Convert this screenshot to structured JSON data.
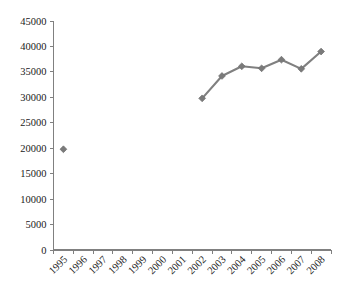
{
  "chart_data": {
    "type": "line",
    "title": "",
    "subtitle": "",
    "xlabel": "",
    "ylabel": "",
    "categories": [
      "1995",
      "1996",
      "1997",
      "1998",
      "1999",
      "2000",
      "2001",
      "2002",
      "2003",
      "2004",
      "2005",
      "2006",
      "2007",
      "2008"
    ],
    "series": [
      {
        "name": "series-1",
        "values": [
          19800,
          null,
          null,
          null,
          null,
          null,
          null,
          29800,
          34200,
          36100,
          35700,
          37400,
          35600,
          39000
        ]
      }
    ],
    "ylim": [
      0,
      45000
    ],
    "ytick_labels": [
      "0",
      "5000",
      "10000",
      "15000",
      "20000",
      "25000",
      "30000",
      "35000",
      "40000",
      "45000"
    ],
    "ytick_values": [
      0,
      5000,
      10000,
      15000,
      20000,
      25000,
      30000,
      35000,
      40000,
      45000
    ],
    "ytick_step": 5000,
    "xtick_rotation": -45,
    "grid": false,
    "legend": false,
    "legend_position": "none",
    "marker": "diamond",
    "colors": {
      "line": "#808080",
      "marker_fill": "#7a7a7a",
      "marker_stroke": "#6e6e6e",
      "axis": "#808080",
      "text": "#1a1a1a",
      "background": "#ffffff"
    }
  }
}
